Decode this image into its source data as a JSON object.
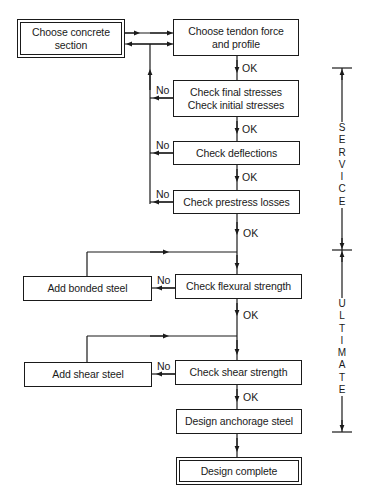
{
  "diagram": {
    "type": "flowchart",
    "boxes": {
      "choose_concrete": "Choose concrete\nsection",
      "choose_tendon": "Choose tendon force\nand profile",
      "check_stresses": "Check final stresses\nCheck initial stresses",
      "check_deflections": "Check deflections",
      "check_prestress": "Check prestress losses",
      "add_bonded": "Add bonded steel",
      "check_flexural": "Check flexural strength",
      "add_shear": "Add shear steel",
      "check_shear": "Check shear strength",
      "design_anchorage": "Design anchorage steel",
      "design_complete": "Design complete"
    },
    "edge_labels": {
      "ok": "OK",
      "no": "No"
    },
    "phases": {
      "service": "SERVICE",
      "ultimate": "ULTIMATE"
    },
    "colors": {
      "line": "#1a1a1a",
      "background": "#ffffff"
    }
  }
}
